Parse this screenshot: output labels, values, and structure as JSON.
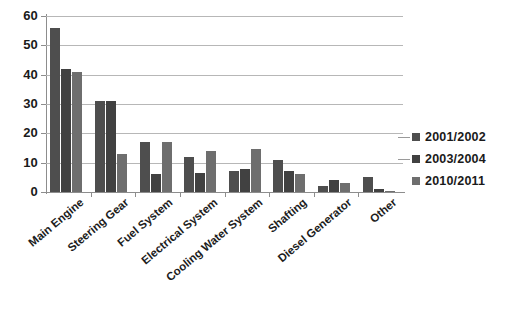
{
  "chart_data": {
    "type": "bar",
    "title": "",
    "subtitle": "",
    "xlabel": "",
    "ylabel": "",
    "ylim": [
      0,
      60
    ],
    "yticks": [
      0,
      10,
      20,
      30,
      40,
      50,
      60
    ],
    "grid": true,
    "legend_position": "right",
    "categories": [
      "Main Engine",
      "Steering Gear",
      "Fuel System",
      "Electrical System",
      "Cooling Water System",
      "Shafting",
      "Diesel Generator",
      "Other"
    ],
    "series": [
      {
        "name": "2001/2002",
        "color": "#4e4e4e",
        "values": [
          56,
          31,
          17,
          12,
          7,
          11,
          2,
          5
        ]
      },
      {
        "name": "2003/2004",
        "color": "#414141",
        "values": [
          42,
          31,
          6,
          6.5,
          8,
          7,
          4,
          1
        ]
      },
      {
        "name": "2010/2011",
        "color": "#6e6e6e",
        "values": [
          41,
          13,
          17,
          14,
          14.5,
          6,
          3,
          0.4
        ]
      }
    ]
  }
}
